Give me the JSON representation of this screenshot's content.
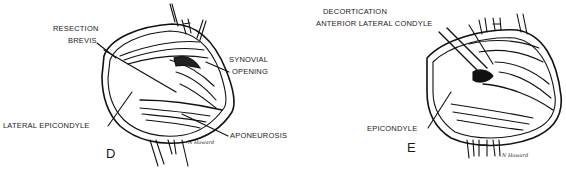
{
  "figure": {
    "panels": [
      {
        "letter": "D",
        "labels": {
          "resection": "RESECTION",
          "brevis": "BREVIS",
          "synovial": "SYNOVIAL",
          "opening": "OPENING",
          "lateral_epicondyle": "LATERAL EPICONDYLE",
          "aponeurosis": "APONEUROSIS"
        },
        "signature": "N Howard"
      },
      {
        "letter": "E",
        "labels": {
          "decortication": "DECORTICATION",
          "anterior_lateral_condyle": "ANTERIOR LATERAL CONDYLE",
          "epicondyle": "EPICONDYLE"
        },
        "signature": "N Howard"
      }
    ]
  }
}
